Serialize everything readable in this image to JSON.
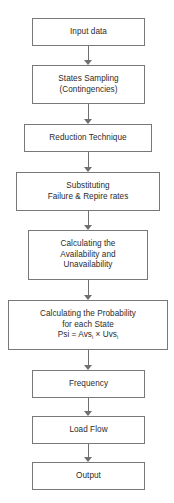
{
  "figure": {
    "type": "flowchart",
    "orientation": "top-to-bottom",
    "background_color": "#ffffff",
    "box_border_color": "#787878",
    "connector_color": "#6f6f6f",
    "text_color": "#2b2b2b",
    "nodes": [
      {
        "id": "input-data",
        "lines": [
          "Input data"
        ],
        "x": 32,
        "y": 18,
        "width": 113,
        "height": 28
      },
      {
        "id": "states-sampling",
        "lines": [
          "States Sampling",
          "(Contingencies)"
        ],
        "x": 32,
        "y": 65,
        "width": 113,
        "height": 39
      },
      {
        "id": "reduction-technique",
        "lines": [
          "Reduction Technique"
        ],
        "x": 24,
        "y": 124,
        "width": 128,
        "height": 28
      },
      {
        "id": "substituting-rates",
        "lines": [
          "Substituting",
          "Failure & Repire rates"
        ],
        "x": 16,
        "y": 172,
        "width": 144,
        "height": 39
      },
      {
        "id": "calculating-availability",
        "lines": [
          "Calculating the",
          "Availability and",
          "Unavailability"
        ],
        "x": 28,
        "y": 230,
        "width": 120,
        "height": 50
      },
      {
        "id": "calculating-probability",
        "lines": [
          "Calculating the Probability",
          "for each State"
        ],
        "formula": {
          "prefix": "Psi = Avs",
          "sub1": "i",
          "operator": " × Uvs",
          "sub2": "i"
        },
        "x": 8,
        "y": 300,
        "width": 160,
        "height": 50
      },
      {
        "id": "frequency",
        "lines": [
          "Frequency"
        ],
        "x": 32,
        "y": 370,
        "width": 113,
        "height": 28
      },
      {
        "id": "load-flow",
        "lines": [
          "Load Flow"
        ],
        "x": 32,
        "y": 416,
        "width": 113,
        "height": 28
      },
      {
        "id": "output",
        "lines": [
          "Output"
        ],
        "x": 32,
        "y": 462,
        "width": 113,
        "height": 28
      }
    ],
    "connectors": [
      {
        "id": "arrow-input-to-sampling",
        "x": 88,
        "y": 46,
        "length": 19
      },
      {
        "id": "arrow-sampling-to-reduction",
        "x": 88,
        "y": 104,
        "length": 20
      },
      {
        "id": "arrow-reduction-to-substituting",
        "x": 88,
        "y": 152,
        "length": 20
      },
      {
        "id": "arrow-substituting-to-avail",
        "x": 88,
        "y": 211,
        "length": 19
      },
      {
        "id": "arrow-avail-to-probability",
        "x": 88,
        "y": 280,
        "length": 20
      },
      {
        "id": "arrow-probability-to-frequency",
        "x": 88,
        "y": 350,
        "length": 20
      },
      {
        "id": "arrow-frequency-to-loadflow",
        "x": 88,
        "y": 398,
        "length": 18
      },
      {
        "id": "arrow-loadflow-to-output",
        "x": 88,
        "y": 444,
        "length": 18
      }
    ]
  }
}
